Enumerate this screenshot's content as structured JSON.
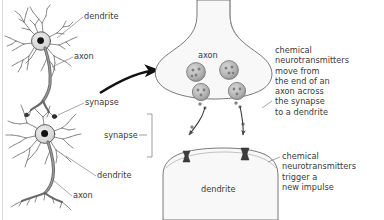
{
  "figure": {
    "background_color": "#ffffff",
    "text_color": "#3a3a3a",
    "line_color": "#555555",
    "arrow_color": "#111111",
    "cell_fill": "#f7f7f7",
    "vesicle_fill": "#b8b8b8",
    "receptor_fill": "#3c3c3c"
  },
  "labels": {
    "upper_dendrite": "dendrite",
    "upper_axon": "axon",
    "left_synapse": "synapse",
    "lower_dendrite": "dendrite",
    "lower_axon": "axon",
    "magnified_axon": "axon",
    "bracket_synapse": "synapse",
    "magnified_dendrite": "dendrite"
  },
  "callouts": {
    "top": "chemical\nneurotransmitters\nmove from\nthe end of an\naxon across\nthe synapse\nto a dendrite",
    "bottom": "chemical\nneurotransmitters\ntrigger a\nnew impulse"
  }
}
